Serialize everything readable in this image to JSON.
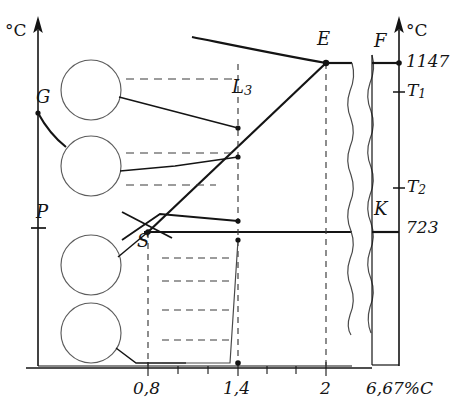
{
  "diagram": {
    "title_hidden": "Iron-carbon phase diagram fragment",
    "axes": {
      "left_unit": "°C",
      "right_unit": "°C",
      "x_unit_label": "6,67%C"
    },
    "left_axis_labels": [
      {
        "id": "G",
        "text": "G",
        "x": 36,
        "y": 95
      },
      {
        "id": "P",
        "text": "P",
        "x": 36,
        "y": 210
      }
    ],
    "right_axis_labels": [
      {
        "id": "F",
        "text": "F",
        "x": 376,
        "y": 40
      },
      {
        "id": "K",
        "text": "K",
        "x": 376,
        "y": 208
      }
    ],
    "right_axis_values": [
      {
        "id": "v1147",
        "text": "1147",
        "value": 1147,
        "y": 63
      },
      {
        "id": "T1",
        "text": "T",
        "sub": "1",
        "y": 92
      },
      {
        "id": "T2",
        "text": "T",
        "sub": "2",
        "y": 188
      },
      {
        "id": "v723",
        "text": "723",
        "value": 723,
        "y": 228
      }
    ],
    "field_labels": [
      {
        "id": "E",
        "text": "E",
        "x": 317,
        "y": 40
      },
      {
        "id": "L3",
        "text": "L",
        "sub": "3",
        "x": 232,
        "y": 80
      },
      {
        "id": "S",
        "text": "S",
        "x": 139,
        "y": 235
      }
    ],
    "x_ticks": [
      {
        "label": "0,8",
        "value": 0.8,
        "x": 148
      },
      {
        "label": "1,4",
        "value": 1.4,
        "x": 238
      },
      {
        "label": "2",
        "value": 2,
        "x": 326
      }
    ],
    "x_end_label": {
      "label": "6,67%C",
      "x": 392
    },
    "micrographs": [
      {
        "id": "circle-1",
        "cx": 91,
        "cy": 90,
        "r": 30
      },
      {
        "id": "circle-2",
        "cx": 91,
        "cy": 166,
        "r": 30
      },
      {
        "id": "circle-3",
        "cx": 91,
        "cy": 265,
        "r": 30
      },
      {
        "id": "circle-4",
        "cx": 91,
        "cy": 333,
        "r": 30
      }
    ],
    "key_points": [
      {
        "id": "point-G",
        "x": 38,
        "y": 113
      },
      {
        "id": "point-S",
        "x": 148,
        "y": 232
      },
      {
        "id": "point-E",
        "x": 326,
        "y": 63
      },
      {
        "id": "point-L3",
        "x": 238,
        "y": 128
      },
      {
        "id": "point-mid",
        "x": 238,
        "y": 157
      },
      {
        "id": "point-eutectoid",
        "x": 238,
        "y": 221
      },
      {
        "id": "point-below-S",
        "x": 238,
        "y": 240
      },
      {
        "id": "point-bottom",
        "x": 238,
        "y": 363
      },
      {
        "id": "point-1147",
        "x": 399,
        "y": 63
      }
    ],
    "solvus_temps": {
      "eutectic": 1147,
      "eutectoid": 723
    }
  }
}
